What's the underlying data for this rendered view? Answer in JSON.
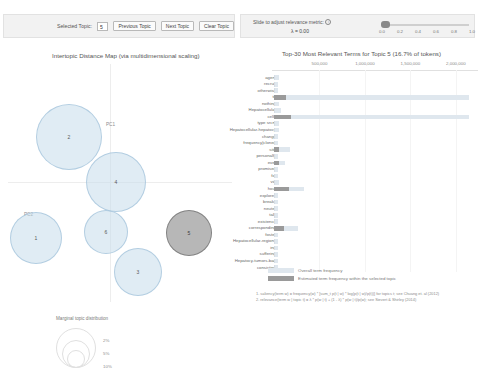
{
  "topic_control": {
    "label": "Selected Topic:",
    "value": "5",
    "prev_label": "Previous Topic",
    "next_label": "Next Topic",
    "clear_label": "Clear Topic"
  },
  "lambda_control": {
    "title": "Slide to adjust relevance metric:",
    "info_icon": "info-icon",
    "value_label": "λ = 0.00",
    "lambda": 0.0,
    "ticks": [
      "0.0",
      "0.2",
      "0.4",
      "0.6",
      "0.8",
      "1.0"
    ]
  },
  "left_panel": {
    "title": "Intertopic Distance Map (via multidimensional scaling)",
    "x_axis_label": "PC1",
    "y_axis_label": "PC2",
    "marginal_title": "Marginal topic distribution",
    "marginal_sizes": [
      "2%",
      "5%",
      "10%"
    ]
  },
  "right_panel": {
    "title": "Top-30 Most Relevant Terms for Topic 5 (16.7% of tokens)",
    "xticks": [
      "500,000",
      "1,000,000",
      "1,500,000",
      "2,000,000"
    ],
    "xmax": 2200000,
    "legend": [
      {
        "swatch": "overall",
        "text": "Overall term frequency"
      },
      {
        "swatch": "within",
        "text": "Estimated term frequency within the selected topic"
      }
    ],
    "notes": [
      "1. saliency(term w) = frequency(w) * [sum_t p(t | w) * log(p(t | w)/p(t))] for topics t; see Chuang et. al (2012)",
      "2. relevance(term w | topic t) = λ * p(w | t) + (1 - λ) * p(w | t)/p(w); see Sievert & Shirley (2014)"
    ]
  },
  "chart_data": {
    "type": "bar",
    "title": "Top-30 Most Relevant Terms for Topic 5 (16.7% of tokens)",
    "xlabel": "",
    "ylabel": "",
    "xlim": [
      0,
      2200000
    ],
    "grid": true,
    "legend_position": "bottom",
    "categories": [
      "agent",
      "recruit",
      "otherwise",
      "to",
      "nothing",
      "Hepatocellular",
      "cells",
      "type srcm",
      "Hepatocellular-hepatocy",
      "change",
      "frequency|cloned",
      "site",
      "personally",
      "ever",
      "promised",
      "fat",
      "via",
      "hout",
      "explores",
      "breaks",
      "neuter",
      "talk",
      "existence",
      "corresponding",
      "foster",
      "Hepatocellular-regions",
      "ing",
      "suffering",
      "Hepatocy-tumors-bad",
      "consisting"
    ],
    "series": [
      {
        "name": "Overall term frequency",
        "values": [
          60000,
          40000,
          40000,
          2150000,
          60000,
          80000,
          2150000,
          60000,
          50000,
          40000,
          40000,
          180000,
          40000,
          120000,
          40000,
          40000,
          60000,
          330000,
          40000,
          40000,
          40000,
          40000,
          40000,
          260000,
          40000,
          40000,
          40000,
          40000,
          40000,
          40000
        ]
      },
      {
        "name": "Estimated term frequency within the selected topic",
        "values": [
          0,
          0,
          0,
          135000,
          0,
          0,
          185000,
          0,
          0,
          0,
          0,
          60000,
          0,
          60000,
          0,
          0,
          0,
          170000,
          0,
          0,
          0,
          0,
          0,
          105000,
          0,
          0,
          0,
          0,
          0,
          0
        ]
      }
    ]
  },
  "topics": [
    {
      "id": "2",
      "x": 36,
      "y": 44,
      "r": 33,
      "selected": false
    },
    {
      "id": "4",
      "x": 86,
      "y": 92,
      "r": 30,
      "selected": false
    },
    {
      "id": "1",
      "x": 10,
      "y": 152,
      "r": 26,
      "selected": false
    },
    {
      "id": "6",
      "x": 84,
      "y": 150,
      "r": 22,
      "selected": false
    },
    {
      "id": "3",
      "x": 114,
      "y": 188,
      "r": 24,
      "selected": false
    },
    {
      "id": "5",
      "x": 166,
      "y": 150,
      "r": 23,
      "selected": true
    }
  ]
}
